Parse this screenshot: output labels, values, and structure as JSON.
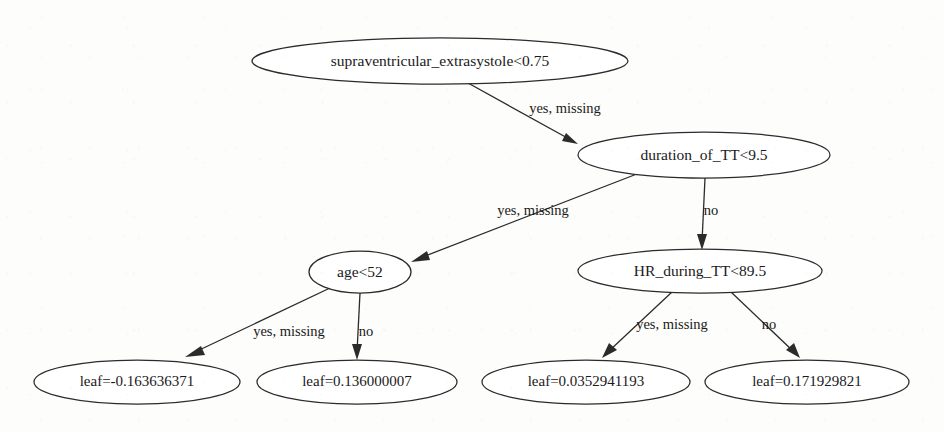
{
  "diagram": {
    "type": "decision-tree",
    "background_color": "#fdfdfb",
    "stroke_color": "#2b2b2b",
    "text_color": "#1a1a1a",
    "nodes": [
      {
        "id": "root",
        "label": "supraventricular_extrasystole<0.75",
        "kind": "split",
        "cx": 440,
        "cy": 61,
        "rx": 188,
        "ry": 23
      },
      {
        "id": "duration",
        "label": "duration_of_TT<9.5",
        "kind": "split",
        "cx": 704,
        "cy": 155,
        "rx": 126,
        "ry": 23
      },
      {
        "id": "age",
        "label": "age<52",
        "kind": "split",
        "cx": 360,
        "cy": 272,
        "rx": 51,
        "ry": 21
      },
      {
        "id": "hr",
        "label": "HR_during_TT<89.5",
        "kind": "split",
        "cx": 700,
        "cy": 271,
        "rx": 122,
        "ry": 22
      },
      {
        "id": "leaf_a",
        "label": "leaf=-0.163636371",
        "kind": "leaf",
        "cx": 137,
        "cy": 382,
        "rx": 103,
        "ry": 22
      },
      {
        "id": "leaf_b",
        "label": "leaf=0.136000007",
        "kind": "leaf",
        "cx": 357,
        "cy": 382,
        "rx": 100,
        "ry": 22
      },
      {
        "id": "leaf_c",
        "label": "leaf=0.0352941193",
        "kind": "leaf",
        "cx": 586,
        "cy": 382,
        "rx": 104,
        "ry": 22
      },
      {
        "id": "leaf_d",
        "label": "leaf=0.171929821",
        "kind": "leaf",
        "cx": 807,
        "cy": 382,
        "rx": 102,
        "ry": 22
      }
    ],
    "edges": [
      {
        "from": "root",
        "to": "duration",
        "label": "yes, missing",
        "label_x": 565,
        "label_y": 110
      },
      {
        "from": "duration",
        "to": "age",
        "label": "yes, missing",
        "label_x": 533,
        "label_y": 212
      },
      {
        "from": "duration",
        "to": "hr",
        "label": "no",
        "label_x": 711,
        "label_y": 212
      },
      {
        "from": "age",
        "to": "leaf_a",
        "label": "yes, missing",
        "label_x": 289,
        "label_y": 333
      },
      {
        "from": "age",
        "to": "leaf_b",
        "label": "no",
        "label_x": 366,
        "label_y": 333
      },
      {
        "from": "hr",
        "to": "leaf_c",
        "label": "yes, missing",
        "label_x": 672,
        "label_y": 326
      },
      {
        "from": "hr",
        "to": "leaf_d",
        "label": "no",
        "label_x": 769,
        "label_y": 326
      }
    ]
  }
}
